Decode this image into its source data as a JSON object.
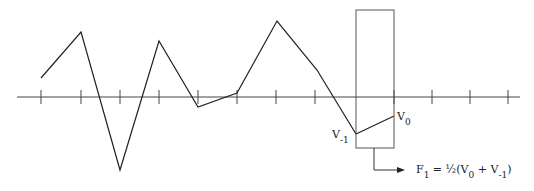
{
  "diagram": {
    "axis": {
      "y": 97,
      "x_start": 17,
      "x_end": 520,
      "ticks_x": [
        41,
        81,
        120,
        159,
        198,
        237,
        276,
        315,
        394,
        432,
        470,
        508
      ]
    },
    "waveform_points": [
      [
        41,
        78
      ],
      [
        81,
        32
      ],
      [
        120,
        170
      ],
      [
        159,
        41
      ],
      [
        198,
        107
      ],
      [
        237,
        93
      ],
      [
        277,
        21
      ],
      [
        317,
        70
      ],
      [
        356,
        134
      ],
      [
        394,
        116
      ]
    ],
    "window_box": {
      "x": 356,
      "y": 10,
      "width": 38,
      "height": 138
    },
    "arrow": {
      "stem_x": 374,
      "from_y": 148,
      "to_y": 170,
      "to_x": 403
    },
    "labels": {
      "v0": {
        "base": "V",
        "sub": "0"
      },
      "v_minus1": {
        "base": "V",
        "sub": "-1"
      },
      "formula": {
        "lhs_base": "F",
        "lhs_sub": "1",
        "eq": " = ½(V",
        "t1_sub": "0",
        "plus": " + V",
        "t2_sub": "-1",
        "close": ")"
      }
    },
    "colors": {
      "line": "#222222",
      "box": "#555555",
      "axis": "#444444"
    }
  }
}
